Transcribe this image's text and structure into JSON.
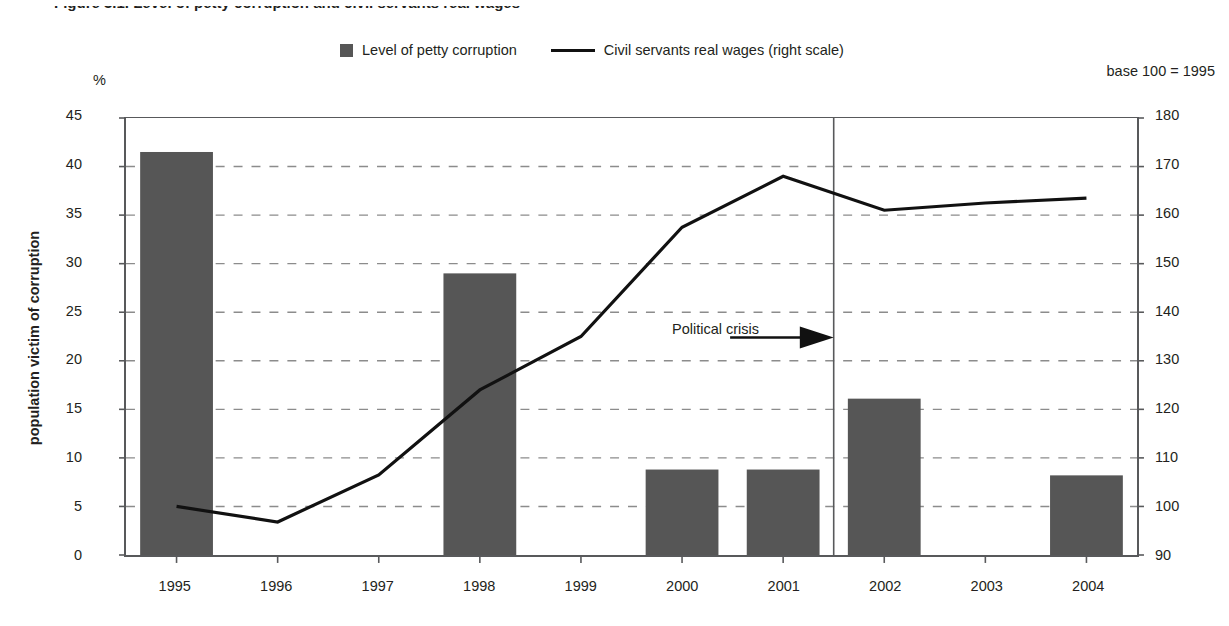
{
  "figure": {
    "title": "Figure 3.1. Level of petty corruption and civil servants real wages",
    "unit_label": "%",
    "base_note": "base 100 = 1995",
    "y_axis_title": "population victim of corruption"
  },
  "legend": {
    "position": "top-center",
    "items": [
      {
        "label": "Level of petty corruption",
        "marker": "square-swatch",
        "color": "#565656"
      },
      {
        "label": "Civil servants real wages (right scale)",
        "marker": "line",
        "color": "#111111"
      }
    ]
  },
  "annotations": [
    {
      "label": "Political crisis",
      "icon": "right-arrow-icon",
      "at_x": "2001.5"
    }
  ],
  "chart_data": {
    "type": "bar",
    "title": "Figure 3.1. Level of petty corruption and civil servants real wages",
    "xlabel": "",
    "ylabel": "population victim of corruption",
    "y2label": "",
    "categories": [
      "1995",
      "1996",
      "1997",
      "1998",
      "1999",
      "2000",
      "2001",
      "2002",
      "2003",
      "2004"
    ],
    "ylim": [
      0,
      45
    ],
    "yticks": [
      0,
      5,
      10,
      15,
      20,
      25,
      30,
      35,
      40,
      45
    ],
    "y2lim": [
      90,
      180
    ],
    "y2ticks": [
      90,
      100,
      110,
      120,
      130,
      140,
      150,
      160,
      170,
      180
    ],
    "grid": "horizontal-dashed",
    "legend_position": "top-center",
    "series": [
      {
        "name": "Level of petty corruption",
        "kind": "bar",
        "axis": "left",
        "unit": "%",
        "color": "#565656",
        "values": [
          41.5,
          null,
          null,
          29.0,
          null,
          8.8,
          8.8,
          16.1,
          null,
          8.2
        ]
      },
      {
        "name": "Civil servants real wages (right scale)",
        "kind": "line",
        "axis": "right",
        "unit": "index, base 100 = 1995",
        "color": "#111111",
        "values": [
          100,
          96.8,
          106.5,
          124.0,
          135.0,
          157.5,
          168.0,
          161.0,
          162.5,
          163.5
        ]
      }
    ],
    "vertical_marker": {
      "label": "Political crisis",
      "x": "2001.5"
    }
  },
  "ticks": {
    "left": [
      "45",
      "40",
      "35",
      "30",
      "25",
      "20",
      "15",
      "10",
      "5",
      "0"
    ],
    "right": [
      "180",
      "170",
      "160",
      "150",
      "140",
      "130",
      "120",
      "110",
      "100",
      "90"
    ],
    "x": [
      "1995",
      "1996",
      "1997",
      "1998",
      "1999",
      "2000",
      "2001",
      "2002",
      "2003",
      "2004"
    ]
  }
}
